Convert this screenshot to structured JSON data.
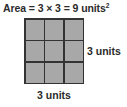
{
  "figure": {
    "background_color": "#ffffff",
    "equation": {
      "full_text": "Area = 3 × 3 = 9 units²",
      "label": "Area",
      "equals_1": "=",
      "factor_1": "3",
      "times": "×",
      "factor_2": "3",
      "equals_2": "=",
      "product": "9",
      "unit": "units",
      "exponent": "2"
    },
    "square": {
      "rows": 3,
      "columns": 3,
      "total_cells": 9,
      "cell_fill_color": "#a8a8a8",
      "grid_line_color": "#333333",
      "cells": [
        {
          "row": 1,
          "column": 1
        },
        {
          "row": 1,
          "column": 2
        },
        {
          "row": 1,
          "column": 3
        },
        {
          "row": 2,
          "column": 1
        },
        {
          "row": 2,
          "column": 2
        },
        {
          "row": 2,
          "column": 3
        },
        {
          "row": 3,
          "column": 1
        },
        {
          "row": 3,
          "column": 2
        },
        {
          "row": 3,
          "column": 3
        }
      ]
    },
    "labels": {
      "right": "3 units",
      "bottom": "3 units"
    }
  }
}
